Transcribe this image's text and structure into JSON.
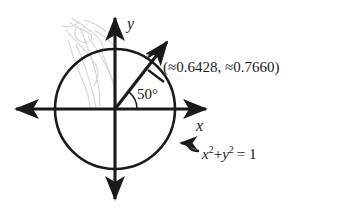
{
  "figure": {
    "background_color": "#ffffff",
    "ink_color": "#1a1a1a",
    "smudge_color": "#cfcfcf"
  },
  "axes": {
    "x_label": "x",
    "y_label": "y",
    "x_axis_name": "horizontal-axis",
    "y_axis_name": "vertical-axis",
    "center": {
      "x": 115,
      "y": 109
    },
    "x_min_px": 10,
    "x_max_px": 212,
    "y_min_px": 12,
    "y_max_px": 205
  },
  "circle": {
    "radius_px": 60,
    "radius_value": 1,
    "equation_parts": {
      "x": "x",
      "exp1": "2",
      "plus": "+",
      "y": "y",
      "exp2": "2",
      "equals": "= 1"
    },
    "equation_text": "x 2 + y 2 = 1"
  },
  "angle": {
    "degrees": 50,
    "label": "50°",
    "arc_radius_px": 22
  },
  "point": {
    "label": "(≈0.6428, ≈0.7660)",
    "x_value": 0.6428,
    "y_value": 0.766,
    "approx_symbol": "≈"
  },
  "annotations": {
    "equation_leader_name": "equation-leader-arrow",
    "point_leader_name": "point-leader-line"
  }
}
